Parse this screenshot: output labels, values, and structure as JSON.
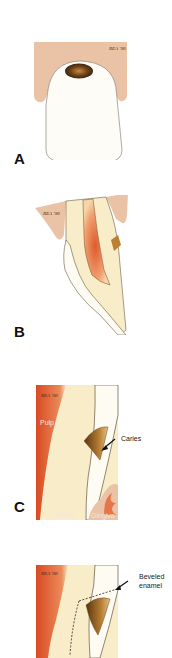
{
  "figure": {
    "panels": [
      {
        "id": "A",
        "label": "A",
        "signature": "REA '90",
        "description": "Frontal view of tooth with caries at cervical area under gingiva"
      },
      {
        "id": "B",
        "label": "B",
        "signature": "REA '90",
        "description": "Sagittal section of tooth showing pulp and cervical caries"
      },
      {
        "id": "C",
        "label": "C",
        "signature": "REA '90",
        "annotations": {
          "pulp": "Pulp",
          "caries": "Caries",
          "dentin": "Dentin",
          "gingiva": "Gingiva"
        }
      },
      {
        "id": "D",
        "label": "",
        "signature": "REA '90",
        "annotations": {
          "beveled": "Beveled",
          "enamel": "enamel"
        }
      }
    ]
  },
  "colors": {
    "gingiva": "#eac3a6",
    "dentin": "#f8edc8",
    "enamel": "#fdfbf2",
    "pulp": "#dd5a2e",
    "caries": "#9a6428",
    "outline": "#5a4a3a"
  }
}
